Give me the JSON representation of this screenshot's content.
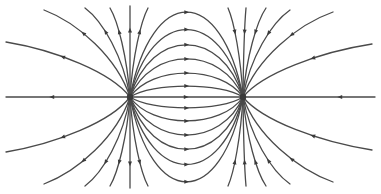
{
  "diagram": {
    "title": "Electric dipole field lines",
    "type": "electric-field-lines",
    "colors": {
      "background": "#ffffff",
      "line": "#4a4a4a",
      "charge": "#3a3a3a"
    },
    "charges": [
      {
        "name": "left-charge",
        "sign": "positive",
        "x": 130,
        "y": 97
      },
      {
        "name": "right-charge",
        "sign": "negative",
        "x": 243,
        "y": 97
      }
    ],
    "axis_line": {
      "x1": 6,
      "x2": 375,
      "y": 97
    },
    "inner_loops_dy": [
      10,
      22,
      35,
      48,
      62,
      78
    ],
    "outer_left": [
      {
        "end": [
          6,
          42
        ]
      },
      {
        "end": [
          44,
          10
        ]
      },
      {
        "end": [
          85,
          8
        ]
      },
      {
        "end": [
          110,
          8
        ]
      },
      {
        "end": [
          130,
          6
        ]
      },
      {
        "end": [
          148,
          8
        ]
      }
    ],
    "outer_right": [
      {
        "end": [
          228,
          8
        ]
      },
      {
        "end": [
          246,
          8
        ]
      },
      {
        "end": [
          266,
          8
        ]
      },
      {
        "end": [
          290,
          10
        ]
      },
      {
        "end": [
          333,
          12
        ]
      },
      {
        "end": [
          372,
          44
        ]
      }
    ]
  }
}
